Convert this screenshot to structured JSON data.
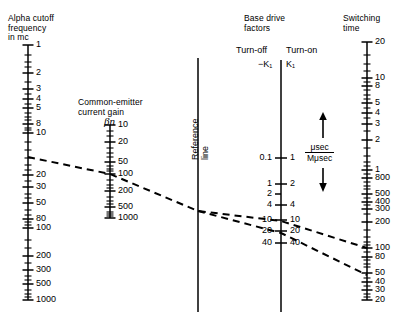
{
  "figure": {
    "type": "nomograph",
    "title_parts": [
      "Alpha cutoff frequency in mc",
      "Common-emitter current gain",
      "Reference line",
      "Base drive factors",
      "Switching time"
    ],
    "background": "#ffffff",
    "ink": "#000000"
  },
  "scales": [
    {
      "id": "alpha-cutoff",
      "header": "Alpha cutoff\nfrequency\nin mc",
      "axis_x": 28,
      "axis_top": 45,
      "axis_bottom": 300,
      "label_side": "right",
      "ticks": [
        {
          "value": "1",
          "y": 45,
          "major": true
        },
        {
          "value": "2",
          "y": 73,
          "major": true
        },
        {
          "value": "3",
          "y": 89,
          "major": true
        },
        {
          "value": "4",
          "y": 99,
          "major": true
        },
        {
          "value": "5",
          "y": 108,
          "major": true
        },
        {
          "value": "8",
          "y": 124,
          "major": true
        },
        {
          "value": "10",
          "y": 133,
          "major": true
        },
        {
          "value": "20",
          "y": 175,
          "major": true
        },
        {
          "value": "30",
          "y": 187,
          "major": true
        },
        {
          "value": "50",
          "y": 203,
          "major": true
        },
        {
          "value": "80",
          "y": 219,
          "major": true
        },
        {
          "value": "100",
          "y": 228,
          "major": true
        },
        {
          "value": "200",
          "y": 256,
          "major": true
        },
        {
          "value": "300",
          "y": 270,
          "major": true
        },
        {
          "value": "500",
          "y": 284,
          "major": true
        },
        {
          "value": "1000",
          "y": 300,
          "major": true
        }
      ],
      "minor_ticks_y": [
        55,
        62,
        67,
        82,
        94,
        104,
        113,
        117,
        120,
        128,
        130,
        142,
        150,
        158,
        165,
        170,
        181,
        194,
        198,
        210,
        215,
        222,
        225,
        240,
        248,
        263,
        276,
        280,
        290,
        294,
        297
      ]
    },
    {
      "id": "current-gain",
      "header": "Common-emitter\ncurrent gain",
      "symbol": "βn",
      "axis_x": 110,
      "axis_top": 125,
      "axis_bottom": 218,
      "label_side": "right",
      "ticks": [
        {
          "value": "10",
          "y": 125,
          "major": true
        },
        {
          "value": "20",
          "y": 142,
          "major": true
        },
        {
          "value": "50",
          "y": 162,
          "major": true
        },
        {
          "value": "100",
          "y": 174,
          "major": true
        },
        {
          "value": "200",
          "y": 191,
          "major": true
        },
        {
          "value": "500",
          "y": 207,
          "major": true
        },
        {
          "value": "1000",
          "y": 218,
          "major": true
        }
      ],
      "minor_ticks_y": [
        131,
        136,
        148,
        153,
        157,
        166,
        169,
        171,
        180,
        185,
        188,
        197,
        201,
        204,
        212,
        214,
        216
      ]
    },
    {
      "id": "reference-line",
      "header": "Reference\nline",
      "axis_x": 198,
      "axis_top": 58,
      "axis_bottom": 312,
      "ticks": [],
      "minor_ticks_y": []
    },
    {
      "id": "base-drive",
      "header": "Base drive\nfactors",
      "sub_left": "Turn-off",
      "sub_right": "Turn-on",
      "sym_left": "−K₁",
      "sym_right": "K₁",
      "axis_x": 281,
      "axis_top": 60,
      "axis_bottom": 312,
      "ticks_left": [
        {
          "value": "0.1",
          "y": 158
        },
        {
          "value": "1",
          "y": 184
        },
        {
          "value": "2",
          "y": 194
        },
        {
          "value": "4",
          "y": 205
        },
        {
          "value": "10",
          "y": 220
        },
        {
          "value": "20",
          "y": 231
        },
        {
          "value": "40",
          "y": 243
        }
      ],
      "ticks_right": [
        {
          "value": "1",
          "y": 158
        },
        {
          "value": "2",
          "y": 184
        },
        {
          "value": "4",
          "y": 205
        },
        {
          "value": "10",
          "y": 220
        },
        {
          "value": "20",
          "y": 231
        },
        {
          "value": "40",
          "y": 243
        }
      ]
    },
    {
      "id": "switching-time",
      "header": "Switching\ntime",
      "axis_x": 367,
      "axis_top": 42,
      "axis_bottom": 300,
      "label_side": "right",
      "ticks": [
        {
          "value": "20",
          "y": 42,
          "major": true
        },
        {
          "value": "10",
          "y": 78,
          "major": true
        },
        {
          "value": "8",
          "y": 86,
          "major": true
        },
        {
          "value": "5",
          "y": 103,
          "major": true
        },
        {
          "value": "4",
          "y": 113,
          "major": true
        },
        {
          "value": "3",
          "y": 124,
          "major": true
        },
        {
          "value": "2",
          "y": 140,
          "major": true
        },
        {
          "value": "1",
          "y": 170,
          "major": true
        },
        {
          "value": "800",
          "y": 178,
          "major": true
        },
        {
          "value": "500",
          "y": 194,
          "major": true
        },
        {
          "value": "400",
          "y": 202,
          "major": true
        },
        {
          "value": "300",
          "y": 209,
          "major": true
        },
        {
          "value": "200",
          "y": 222,
          "major": true
        },
        {
          "value": "100",
          "y": 248,
          "major": true
        },
        {
          "value": "80",
          "y": 257,
          "major": true
        },
        {
          "value": "50",
          "y": 273,
          "major": true
        },
        {
          "value": "40",
          "y": 282,
          "major": true
        },
        {
          "value": "30",
          "y": 290,
          "major": true
        },
        {
          "value": "20",
          "y": 300,
          "major": true
        }
      ],
      "minor_ticks_y": [
        55,
        64,
        71,
        82,
        90,
        95,
        99,
        108,
        118,
        131,
        148,
        156,
        162,
        166,
        174,
        182,
        186,
        189,
        198,
        205,
        214,
        230,
        237,
        242,
        245,
        252,
        260,
        264,
        267,
        278,
        286,
        294,
        297
      ]
    }
  ],
  "annotations": {
    "unit_fraction": {
      "numerator": "μsec",
      "denominator": "Mμsec"
    },
    "arrow_up": "up-arrow",
    "arrow_down": "down-arrow"
  },
  "construction_lines": [
    {
      "id": "line-a",
      "style": "dashed",
      "points": [
        [
          28,
          157
        ],
        [
          110,
          174
        ],
        [
          198,
          211
        ],
        [
          281,
          221
        ],
        [
          367,
          248
        ]
      ]
    },
    {
      "id": "line-b",
      "style": "dashed",
      "points": [
        [
          198,
          211
        ],
        [
          281,
          233
        ],
        [
          367,
          275
        ]
      ]
    }
  ]
}
